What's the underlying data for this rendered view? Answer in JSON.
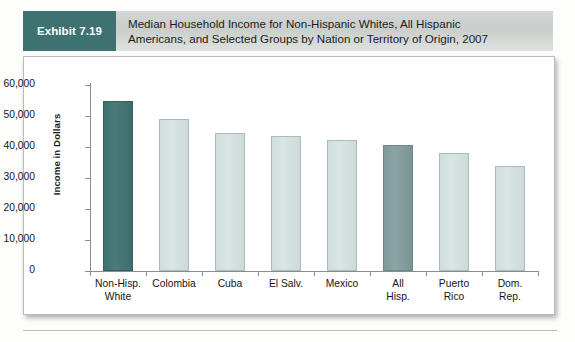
{
  "header": {
    "exhibit_label": "Exhibit 7.19",
    "title_line1": "Median Household Income for Non-Hispanic Whites, All Hispanic",
    "title_line2": "Americans, and Selected Groups by Nation or Territory of Origin, 2007",
    "tag_color": "#3e7271",
    "band_color": "#d2d6d4"
  },
  "chart_data": {
    "type": "bar",
    "title": "Median Household Income for Non-Hispanic Whites, All Hispanic Americans, and Selected Groups by Nation or Territory of Origin, 2007",
    "xlabel": "",
    "ylabel": "Income in Dollars",
    "ylim": [
      0,
      60000
    ],
    "ytick_values": [
      0,
      10000,
      20000,
      30000,
      40000,
      50000,
      60000
    ],
    "ytick_labels": [
      "0",
      "10,000",
      "20,000",
      "30,000",
      "40,000",
      "50,000",
      "60,000"
    ],
    "grid": false,
    "legend": "none",
    "categories": [
      "Non-Hisp. White",
      "Colombia",
      "Cuba",
      "El Salv.",
      "Mexico",
      "All Hisp.",
      "Puerto Rico",
      "Dom. Rep."
    ],
    "category_lines": [
      [
        "Non-Hisp.",
        "White"
      ],
      [
        "Colombia"
      ],
      [
        "Cuba"
      ],
      [
        "El Salv."
      ],
      [
        "Mexico"
      ],
      [
        "All",
        "Hisp."
      ],
      [
        "Puerto",
        "Rico"
      ],
      [
        "Dom.",
        "Rep."
      ]
    ],
    "values": [
      55000,
      49000,
      44400,
      43700,
      42200,
      40800,
      38000,
      34000
    ],
    "bar_styles": [
      "dark",
      "light",
      "light",
      "light",
      "light",
      "mid",
      "light",
      "light"
    ],
    "colors": {
      "dark": "#3e7271",
      "mid": "#859fa0",
      "light": "#d3e0df",
      "axis": "#8a8d8b",
      "text": "#141414"
    }
  }
}
